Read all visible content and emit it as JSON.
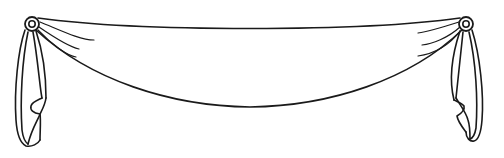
{
  "illustration": {
    "subject": "swag drape valance",
    "style": "black line art on white",
    "colors": {
      "background": "#ffffff",
      "ink": "#1a1a1a"
    },
    "rosettes": [
      {
        "side": "left",
        "cx": 32,
        "cy": 24
      },
      {
        "side": "right",
        "cx": 466,
        "cy": 24
      }
    ],
    "swag": {
      "top_edge_lowest_y": 37,
      "bottom_edge_lowest_y": 107
    },
    "tails": [
      "left",
      "right"
    ]
  }
}
